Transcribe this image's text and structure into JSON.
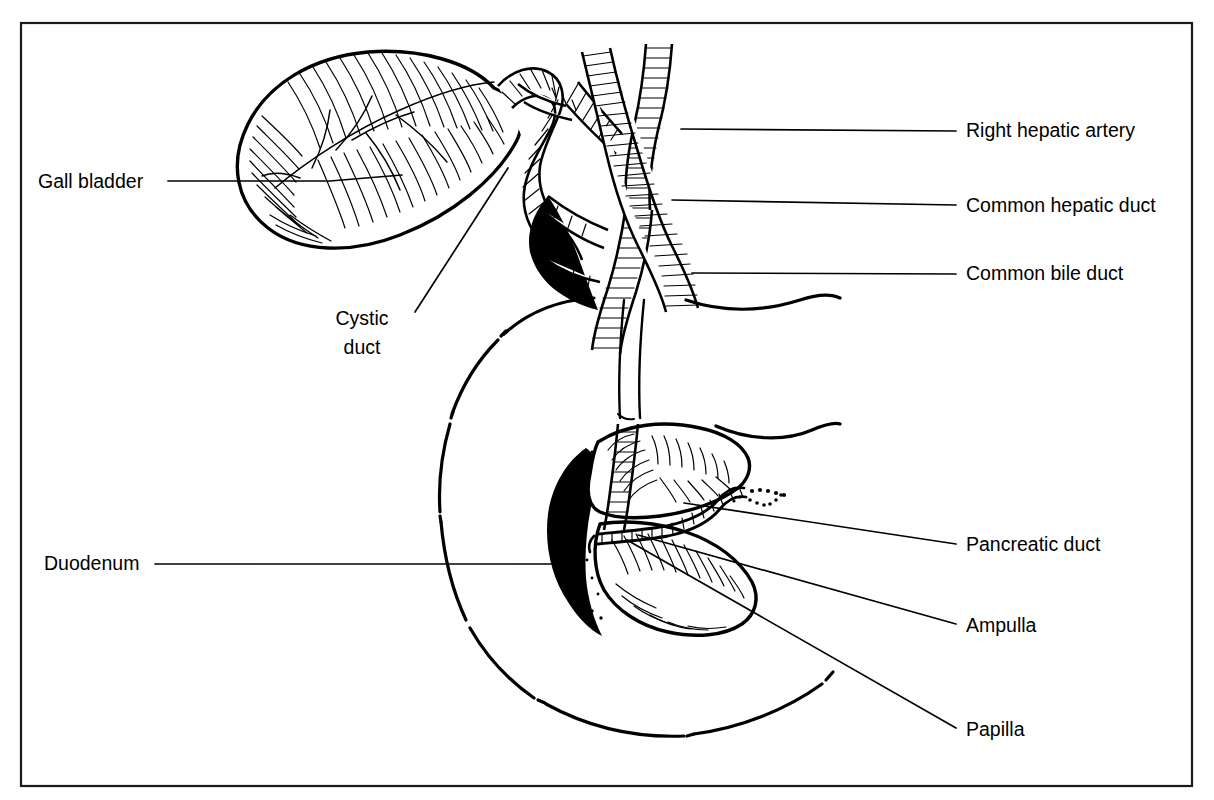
{
  "figure": {
    "background_color": "#ffffff",
    "ink_color": "#000000",
    "border_color": "#1a1a1a",
    "style": "black and white pen-and-ink medical illustration with hatching"
  },
  "labels": [
    {
      "id": "gall-bladder",
      "text": "Gall bladder",
      "side": "left",
      "x": 38,
      "y": 188,
      "lines": [
        "Gall bladder"
      ]
    },
    {
      "id": "cystic-duct",
      "text": "Cystic duct",
      "side": "left",
      "x": 362,
      "y": 325,
      "lines": [
        "Cystic",
        "duct"
      ]
    },
    {
      "id": "duodenum",
      "text": "Duodenum",
      "side": "left",
      "x": 44,
      "y": 570,
      "lines": [
        "Duodenum"
      ]
    },
    {
      "id": "right-hepatic-artery",
      "text": "Right hepatic artery",
      "side": "right",
      "x": 966,
      "y": 137,
      "lines": [
        "Right hepatic artery"
      ]
    },
    {
      "id": "common-hepatic-duct",
      "text": "Common hepatic duct",
      "side": "right",
      "x": 966,
      "y": 212,
      "lines": [
        "Common hepatic duct"
      ]
    },
    {
      "id": "common-bile-duct",
      "text": "Common bile duct",
      "side": "right",
      "x": 966,
      "y": 280,
      "lines": [
        "Common bile duct"
      ]
    },
    {
      "id": "pancreatic-duct",
      "text": "Pancreatic duct",
      "side": "right",
      "x": 966,
      "y": 551,
      "lines": [
        "Pancreatic duct"
      ]
    },
    {
      "id": "ampulla",
      "text": "Ampulla",
      "side": "right",
      "x": 966,
      "y": 632,
      "lines": [
        "Ampulla"
      ]
    },
    {
      "id": "papilla",
      "text": "Papilla",
      "side": "right",
      "x": 966,
      "y": 736,
      "lines": [
        "Papilla"
      ]
    }
  ],
  "structures": [
    {
      "id": "gall-bladder",
      "name": "Gall bladder"
    },
    {
      "id": "cystic-duct",
      "name": "Cystic duct"
    },
    {
      "id": "right-hepatic-artery",
      "name": "Right hepatic artery"
    },
    {
      "id": "common-hepatic-duct",
      "name": "Common hepatic duct"
    },
    {
      "id": "common-bile-duct",
      "name": "Common bile duct"
    },
    {
      "id": "duodenum",
      "name": "Duodenum"
    },
    {
      "id": "pancreatic-duct",
      "name": "Pancreatic duct"
    },
    {
      "id": "ampulla",
      "name": "Ampulla"
    },
    {
      "id": "papilla",
      "name": "Papilla"
    }
  ]
}
